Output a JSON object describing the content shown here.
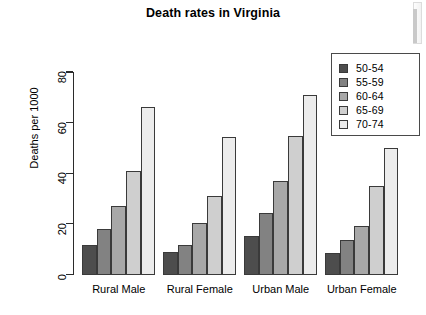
{
  "chart_data": {
    "type": "bar",
    "title": "Death rates in Virginia",
    "xlabel": "",
    "ylabel": "Deaths per 1000",
    "categories": [
      "Rural Male",
      "Rural Female",
      "Urban Male",
      "Urban Female"
    ],
    "series": [
      {
        "name": "50-54",
        "values": [
          11.7,
          8.7,
          15.4,
          8.4
        ],
        "color": "#4d4d4d"
      },
      {
        "name": "55-59",
        "values": [
          18.1,
          11.7,
          24.3,
          13.6
        ],
        "color": "#828282"
      },
      {
        "name": "60-64",
        "values": [
          26.9,
          20.3,
          37.0,
          19.3
        ],
        "color": "#a8a8a8"
      },
      {
        "name": "65-69",
        "values": [
          41.0,
          30.9,
          54.6,
          35.1
        ],
        "color": "#cfcfcf"
      },
      {
        "name": "70-74",
        "values": [
          66.0,
          54.3,
          71.1,
          50.0
        ],
        "color": "#ececec"
      }
    ],
    "ylim": [
      0,
      80
    ],
    "yticks": [
      "0",
      "20",
      "40",
      "60",
      "80"
    ],
    "ytick_values": [
      0,
      20,
      40,
      60,
      80
    ],
    "grid": false,
    "legend_position": "top-right",
    "legend_entries": [
      "50-54",
      "55-59",
      "60-64",
      "65-69",
      "70-74"
    ]
  }
}
